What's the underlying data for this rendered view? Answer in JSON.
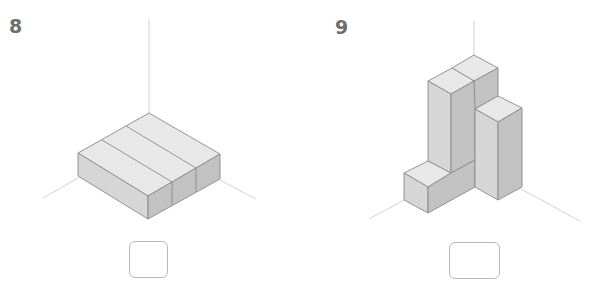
{
  "exercises": [
    {
      "number": "8",
      "description": "Isometric figure: three long rectangular blocks lying side by side on a base",
      "answer_value": ""
    },
    {
      "number": "9",
      "description": "Isometric figure: stacked cube-unit blocks forming two tall columns with a low step in front",
      "answer_value": ""
    }
  ],
  "colors": {
    "top_face": "#e6e6e6",
    "left_face": "#d4d4d4",
    "right_face": "#bdbdbd",
    "edge": "#8a8a8a",
    "axis": "#d0d0d0",
    "label": "#6e6e6e",
    "box_border": "#b9b9b9"
  }
}
